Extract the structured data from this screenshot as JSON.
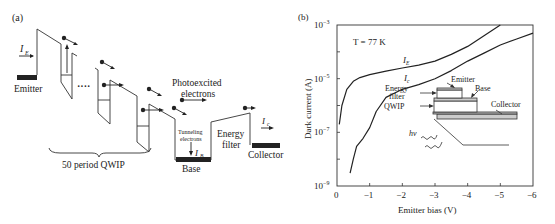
{
  "panel_a": {
    "label": "(a)",
    "emitter_label": "Emitter",
    "ie_label": "I",
    "ie_sub": "E",
    "qwip_label": "50 period QWIP",
    "dots": "····",
    "photo_label_1": "Photoexcited",
    "photo_label_2": "electrons",
    "tunnel_label_1": "Tunneling",
    "tunnel_label_2": "electrons",
    "ib_label": "I",
    "ib_sub": "B",
    "base_label": "Base",
    "filter_label_1": "Energy",
    "filter_label_2": "filter",
    "ic_label": "I",
    "ic_sub": "c",
    "collector_label": "Collector"
  },
  "panel_b": {
    "label": "(b)",
    "temperature_label": "T = 77 K",
    "inset": {
      "emitter": "Emitter",
      "base": "Base",
      "filter_1": "Energy",
      "filter_2": "filter",
      "collector": "Collector",
      "qwip": "QWIP",
      "hv": "hν"
    }
  },
  "chart_data": {
    "type": "line",
    "title": "",
    "annotation": "T = 77 K",
    "xlabel": "Emitter bias (V)",
    "ylabel": "Dark current (A)",
    "xlim": [
      0,
      -6
    ],
    "ylim": [
      1e-09,
      0.001
    ],
    "yscale": "log",
    "x_ticks": [
      "0",
      "−1",
      "−2",
      "−3",
      "−4",
      "−5",
      "−6"
    ],
    "y_ticks": [
      "10−9",
      "10−7",
      "10−5",
      "10−3"
    ],
    "grid": false,
    "series": [
      {
        "name": "I_E",
        "x": [
          -0.07,
          -0.15,
          -0.3,
          -0.5,
          -0.7,
          -1.0,
          -1.5,
          -2.0,
          -2.5,
          -3.0,
          -3.5,
          -4.0,
          -4.5,
          -5.0
        ],
        "y": [
          2e-07,
          1e-06,
          4e-06,
          8e-06,
          1.1e-05,
          1.4e-05,
          1.9e-05,
          2.5e-05,
          3.2e-05,
          4.5e-05,
          8e-05,
          0.00016,
          0.0004,
          0.001
        ]
      },
      {
        "name": "I_c",
        "x": [
          -0.4,
          -0.5,
          -0.6,
          -0.8,
          -1.0,
          -1.2,
          -1.5,
          -2.0,
          -2.5,
          -3.0,
          -3.5,
          -4.0,
          -4.5,
          -5.0,
          -5.5,
          -6.0
        ],
        "y": [
          3e-09,
          1e-08,
          3e-08,
          6e-08,
          1.5e-07,
          6e-07,
          2e-06,
          4e-06,
          6e-06,
          1e-05,
          2e-05,
          4.5e-05,
          9e-05,
          0.00018,
          0.0003,
          0.0005
        ]
      }
    ]
  }
}
